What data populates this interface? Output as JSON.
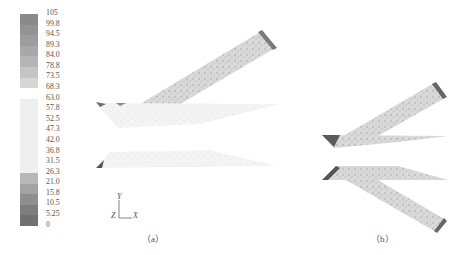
{
  "legend": {
    "ticks": [
      "105",
      "99.8",
      "94.5",
      "89.3",
      "84.0",
      "78.8",
      "73.5",
      "68.3",
      "63.0",
      "57.8",
      "52.5",
      "47.3",
      "42.0",
      "36.8",
      "31.5",
      "26.3",
      "21.0",
      "15.8",
      "10.5",
      "5.25",
      "0"
    ],
    "colors": [
      "#8a8a8a",
      "#939393",
      "#9d9d9d",
      "#a8a8a8",
      "#b5b5b5",
      "#c5c5c5",
      "#d6d6d6",
      "#ffffff",
      "#efefef",
      "#efefef",
      "#efefef",
      "#efefef",
      "#efefef",
      "#efefef",
      "#efefef",
      "#b8b8b8",
      "#a3a3a3",
      "#8e8e8e",
      "#7d7d7d",
      "#707070"
    ]
  },
  "axes": {
    "y_label": "Y",
    "x_label": "X",
    "z_label": "Z"
  },
  "captions": {
    "a": "（a）",
    "b": "（b）"
  }
}
